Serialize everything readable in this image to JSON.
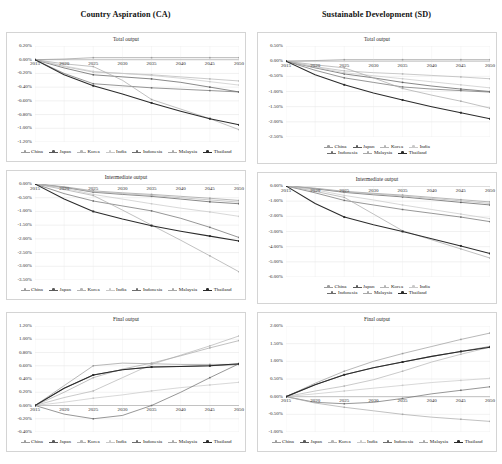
{
  "columns": {
    "ca_title": "Country Aspiration (CA)",
    "sd_title": "Sustainable Development (SD)"
  },
  "series_names": [
    "China",
    "Japan",
    "Korea",
    "India",
    "Indonesia",
    "Malaysia",
    "Thailand"
  ],
  "series_colors": [
    "#9c9c9c",
    "#5a5a5a",
    "#b5b5b5",
    "#c9c9c9",
    "#6e6e6e",
    "#a8a8a8",
    "#2b2b2b"
  ],
  "x": [
    2015,
    2020,
    2025,
    2030,
    2035,
    2040,
    2045,
    2050
  ],
  "chart_data": [
    {
      "id": "ca-total",
      "type": "line",
      "scenario": "Country Aspiration (CA)",
      "title": "Total output",
      "xlabel": "",
      "ylabel": "",
      "grid": true,
      "legend_position": "bottom",
      "legend_rows": 1,
      "x": [
        2015,
        2020,
        2025,
        2030,
        2035,
        2040,
        2045,
        2050
      ],
      "xticks": [
        "2015",
        "2020",
        "2025",
        "2030",
        "2035",
        "2040",
        "2045",
        "2050"
      ],
      "yticks": [
        "0.20%",
        "0.00%",
        "-0.20%",
        "-0.40%",
        "-0.60%",
        "-0.80%",
        "-1.00%",
        "-1.20%"
      ],
      "ylim": [
        -1.2,
        0.2
      ],
      "series": [
        {
          "name": "China",
          "values": [
            0.0,
            0.01,
            0.03,
            0.03,
            0.03,
            0.03,
            0.03,
            0.03
          ]
        },
        {
          "name": "Japan",
          "values": [
            0.0,
            -0.12,
            -0.22,
            -0.25,
            -0.28,
            -0.33,
            -0.4,
            -0.47
          ]
        },
        {
          "name": "Korea",
          "values": [
            0.0,
            -0.1,
            -0.18,
            -0.2,
            -0.22,
            -0.25,
            -0.28,
            -0.31
          ]
        },
        {
          "name": "India",
          "values": [
            0.0,
            -0.09,
            -0.17,
            -0.2,
            -0.23,
            -0.27,
            -0.32,
            -0.37
          ]
        },
        {
          "name": "Indonesia",
          "values": [
            0.0,
            -0.2,
            -0.35,
            -0.38,
            -0.41,
            -0.43,
            -0.45,
            -0.47
          ]
        },
        {
          "name": "Malaysia",
          "values": [
            0.0,
            -0.06,
            -0.1,
            -0.3,
            -0.58,
            -0.72,
            -0.86,
            -1.02
          ]
        },
        {
          "name": "Thailand",
          "values": [
            0.0,
            -0.22,
            -0.38,
            -0.5,
            -0.63,
            -0.75,
            -0.86,
            -0.95
          ]
        }
      ]
    },
    {
      "id": "sd-total",
      "type": "line",
      "scenario": "Sustainable Development (SD)",
      "title": "Total output",
      "xlabel": "",
      "ylabel": "",
      "grid": true,
      "legend_position": "bottom",
      "legend_rows": 2,
      "x": [
        2015,
        2020,
        2025,
        2030,
        2035,
        2040,
        2045,
        2050
      ],
      "xticks": [
        "2015",
        "2020",
        "2025",
        "2030",
        "2035",
        "2040",
        "2045",
        "2050"
      ],
      "yticks": [
        "0.50%",
        "0.00%",
        "-0.50%",
        "-1.00%",
        "-1.50%",
        "-2.00%",
        "-2.50%"
      ],
      "ylim": [
        -2.5,
        0.5
      ],
      "series": [
        {
          "name": "China",
          "values": [
            0.0,
            0.02,
            0.05,
            0.05,
            0.05,
            0.05,
            0.05,
            0.05
          ]
        },
        {
          "name": "Japan",
          "values": [
            0.0,
            -0.22,
            -0.42,
            -0.55,
            -0.7,
            -0.82,
            -0.92,
            -1.0
          ]
        },
        {
          "name": "Korea",
          "values": [
            0.0,
            -0.18,
            -0.32,
            -0.38,
            -0.42,
            -0.47,
            -0.52,
            -0.58
          ]
        },
        {
          "name": "India",
          "values": [
            0.0,
            -0.2,
            -0.38,
            -0.48,
            -0.58,
            -0.68,
            -0.78,
            -0.88
          ]
        },
        {
          "name": "Indonesia",
          "values": [
            0.0,
            -0.3,
            -0.55,
            -0.7,
            -0.85,
            -0.92,
            -0.97,
            -1.02
          ]
        },
        {
          "name": "Malaysia",
          "values": [
            0.0,
            -0.12,
            -0.22,
            -0.55,
            -0.9,
            -1.12,
            -1.32,
            -1.55
          ]
        },
        {
          "name": "Thailand",
          "values": [
            0.0,
            -0.45,
            -0.78,
            -1.05,
            -1.28,
            -1.5,
            -1.7,
            -1.9
          ]
        }
      ]
    },
    {
      "id": "ca-intermediate",
      "type": "line",
      "scenario": "Country Aspiration (CA)",
      "title": "Intermediate output",
      "xlabel": "",
      "ylabel": "",
      "grid": true,
      "legend_position": "bottom",
      "legend_rows": 1,
      "x": [
        2015,
        2020,
        2025,
        2030,
        2035,
        2040,
        2045,
        2050
      ],
      "xticks": [
        "2015",
        "2020",
        "2025",
        "2030",
        "2035",
        "2040",
        "2045",
        "2050"
      ],
      "yticks": [
        "0.00%",
        "-0.50%",
        "-1.00%",
        "-1.50%",
        "-2.00%",
        "-2.50%",
        "-3.00%",
        "-3.50%"
      ],
      "ylim": [
        -3.5,
        0.0
      ],
      "series": [
        {
          "name": "China",
          "values": [
            0.0,
            -0.1,
            -0.25,
            -0.32,
            -0.38,
            -0.45,
            -0.52,
            -0.6
          ]
        },
        {
          "name": "Japan",
          "values": [
            0.0,
            -0.12,
            -0.3,
            -0.38,
            -0.45,
            -0.55,
            -0.65,
            -0.72
          ]
        },
        {
          "name": "Korea",
          "values": [
            0.0,
            -0.11,
            -0.28,
            -0.35,
            -0.42,
            -0.5,
            -0.58,
            -0.66
          ]
        },
        {
          "name": "India",
          "values": [
            0.0,
            -0.15,
            -0.38,
            -0.55,
            -0.72,
            -0.88,
            -1.02,
            -1.18
          ]
        },
        {
          "name": "Indonesia",
          "values": [
            0.0,
            -0.35,
            -0.62,
            -0.8,
            -0.98,
            -1.25,
            -1.58,
            -1.95
          ]
        },
        {
          "name": "Malaysia",
          "values": [
            0.0,
            -0.2,
            -0.42,
            -0.95,
            -1.5,
            -2.05,
            -2.62,
            -3.2
          ]
        },
        {
          "name": "Thailand",
          "values": [
            0.0,
            -0.55,
            -1.0,
            -1.28,
            -1.52,
            -1.72,
            -1.9,
            -2.08
          ]
        }
      ]
    },
    {
      "id": "sd-intermediate",
      "type": "line",
      "scenario": "Sustainable Development (SD)",
      "title": "Intermediate output",
      "xlabel": "",
      "ylabel": "",
      "grid": true,
      "legend_position": "bottom",
      "legend_rows": 2,
      "x": [
        2015,
        2020,
        2025,
        2030,
        2035,
        2040,
        2045,
        2050
      ],
      "xticks": [
        "2015",
        "2020",
        "2025",
        "2030",
        "2035",
        "2040",
        "2045",
        "2050"
      ],
      "yticks": [
        "0.00%",
        "-1.00%",
        "-2.00%",
        "-3.00%",
        "-4.00%",
        "-5.00%",
        "-6.00%"
      ],
      "ylim": [
        -6.0,
        0.0
      ],
      "series": [
        {
          "name": "China",
          "values": [
            0.0,
            -0.15,
            -0.35,
            -0.48,
            -0.6,
            -0.75,
            -0.9,
            -1.05
          ]
        },
        {
          "name": "Japan",
          "values": [
            0.0,
            -0.18,
            -0.42,
            -0.58,
            -0.72,
            -0.9,
            -1.08,
            -1.25
          ]
        },
        {
          "name": "Korea",
          "values": [
            0.0,
            -0.16,
            -0.38,
            -0.52,
            -0.66,
            -0.82,
            -0.98,
            -1.15
          ]
        },
        {
          "name": "India",
          "values": [
            0.0,
            -0.25,
            -0.62,
            -0.92,
            -1.25,
            -1.55,
            -1.85,
            -2.15
          ]
        },
        {
          "name": "Indonesia",
          "values": [
            0.0,
            -0.45,
            -0.95,
            -1.25,
            -1.55,
            -1.8,
            -2.05,
            -2.35
          ]
        },
        {
          "name": "Malaysia",
          "values": [
            0.0,
            -0.35,
            -0.75,
            -1.85,
            -2.95,
            -3.55,
            -4.15,
            -4.75
          ]
        },
        {
          "name": "Thailand",
          "values": [
            0.0,
            -1.15,
            -2.05,
            -2.55,
            -3.0,
            -3.48,
            -3.95,
            -4.45
          ]
        }
      ]
    },
    {
      "id": "ca-final",
      "type": "line",
      "scenario": "Country Aspiration (CA)",
      "title": "Final output",
      "xlabel": "",
      "ylabel": "",
      "grid": true,
      "legend_position": "bottom",
      "legend_rows": 1,
      "x": [
        2015,
        2020,
        2025,
        2030,
        2035,
        2040,
        2045,
        2050
      ],
      "xticks": [
        "2015",
        "2020",
        "2025",
        "2030",
        "2035",
        "2040",
        "2045",
        "2050"
      ],
      "yticks": [
        "1.20%",
        "1.00%",
        "0.80%",
        "0.60%",
        "0.40%",
        "0.20%",
        "0.00%",
        "-0.20%",
        "-0.40%"
      ],
      "ylim": [
        -0.4,
        1.2
      ],
      "series": [
        {
          "name": "China",
          "values": [
            0.0,
            0.3,
            0.6,
            0.64,
            0.63,
            0.62,
            0.62,
            0.62
          ]
        },
        {
          "name": "Japan",
          "values": [
            0.0,
            0.26,
            0.46,
            0.54,
            0.58,
            0.59,
            0.6,
            0.62
          ]
        },
        {
          "name": "Korea",
          "values": [
            0.0,
            0.12,
            0.22,
            0.42,
            0.62,
            0.76,
            0.9,
            1.05
          ]
        },
        {
          "name": "India",
          "values": [
            0.0,
            0.05,
            0.11,
            0.16,
            0.22,
            0.27,
            0.31,
            0.35
          ]
        },
        {
          "name": "Indonesia",
          "values": [
            0.0,
            -0.13,
            -0.2,
            -0.15,
            0.0,
            0.2,
            0.42,
            0.63
          ]
        },
        {
          "name": "Malaysia",
          "values": [
            0.0,
            0.2,
            0.42,
            0.55,
            0.64,
            0.75,
            0.87,
            0.98
          ]
        },
        {
          "name": "Thailand",
          "values": [
            0.0,
            0.26,
            0.46,
            0.54,
            0.58,
            0.59,
            0.6,
            0.63
          ]
        }
      ]
    },
    {
      "id": "sd-final",
      "type": "line",
      "scenario": "Sustainable Development (SD)",
      "title": "Final output",
      "xlabel": "",
      "ylabel": "",
      "grid": true,
      "legend_position": "bottom",
      "legend_rows": 1,
      "x": [
        2015,
        2020,
        2025,
        2030,
        2035,
        2040,
        2045,
        2050
      ],
      "xticks": [
        "2015",
        "2020",
        "2025",
        "2030",
        "2035",
        "2040",
        "2045",
        "2050"
      ],
      "yticks": [
        "2.00%",
        "1.50%",
        "1.00%",
        "0.50%",
        "0.00%",
        "-0.50%",
        "-1.00%"
      ],
      "ylim": [
        -1.0,
        2.0
      ],
      "series": [
        {
          "name": "China",
          "values": [
            0.0,
            0.38,
            0.72,
            1.0,
            1.22,
            1.42,
            1.62,
            1.8
          ]
        },
        {
          "name": "Japan",
          "values": [
            0.0,
            0.34,
            0.62,
            0.82,
            0.98,
            1.14,
            1.28,
            1.42
          ]
        },
        {
          "name": "Korea",
          "values": [
            0.0,
            0.16,
            0.3,
            0.48,
            0.72,
            0.98,
            1.2,
            1.4
          ]
        },
        {
          "name": "India",
          "values": [
            0.0,
            0.08,
            0.16,
            0.24,
            0.32,
            0.4,
            0.46,
            0.52
          ]
        },
        {
          "name": "Indonesia",
          "values": [
            0.0,
            -0.16,
            -0.2,
            -0.16,
            -0.05,
            0.08,
            0.18,
            0.28
          ]
        },
        {
          "name": "Malaysia",
          "values": [
            0.0,
            -0.18,
            -0.3,
            -0.4,
            -0.5,
            -0.58,
            -0.64,
            -0.7
          ]
        },
        {
          "name": "Thailand",
          "values": [
            0.0,
            0.34,
            0.62,
            0.82,
            0.98,
            1.14,
            1.28,
            1.4
          ]
        }
      ]
    }
  ]
}
